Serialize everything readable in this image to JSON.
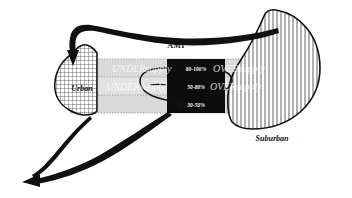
{
  "diagram": {
    "title_center": "AMI",
    "regions": {
      "left": {
        "name": "Urban",
        "fill_pattern": "cross-hatch"
      },
      "right": {
        "name": "Suburban",
        "fill_pattern": "vertical-lines"
      }
    },
    "ami_bands": [
      {
        "id": "band-top",
        "label": "80-100%"
      },
      {
        "id": "band-middle",
        "label": "50-80%"
      },
      {
        "id": "band-bottom",
        "label": "30-50%"
      }
    ],
    "supply_labels": {
      "under_row1": "UNDERsupply",
      "under_row2": "UNDERsupply",
      "over_row1": "OVERsupply",
      "over_row2": "OVERsupply"
    },
    "colors": {
      "band_fill": "#d9d9d9",
      "band_fill_alt": "#e6e6e6",
      "ami_box_fill": "#0d0d0d",
      "stroke": "#111111",
      "page_background": "#ffffff",
      "hatch_line": "#3a3a3a"
    },
    "arrows": [
      {
        "id": "arrow-suburban-to-urban",
        "from": "Suburban",
        "to": "Urban",
        "direction": "down-left"
      },
      {
        "id": "arrow-urban-outflow",
        "from": "Urban",
        "to": "off-diagram",
        "direction": "down-left"
      },
      {
        "id": "arrow-ami-outflow",
        "from": "30-50%",
        "to": "off-diagram",
        "direction": "down-left"
      },
      {
        "id": "arrow-band-top-to-middle",
        "from": "80-100%",
        "to": "50-80%",
        "direction": "loop-right"
      },
      {
        "id": "arrow-band-middle-to-bottom",
        "from": "50-80%",
        "to": "30-50%",
        "direction": "loop-left"
      }
    ]
  }
}
